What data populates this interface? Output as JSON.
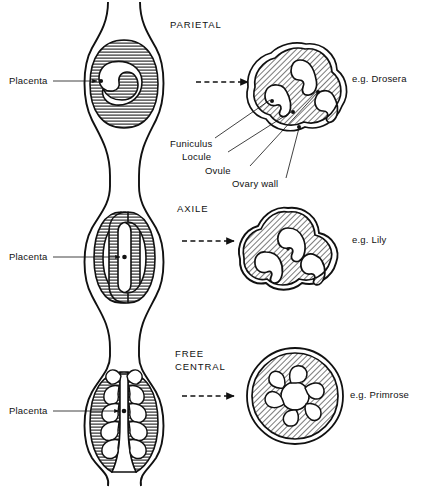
{
  "diagram": {
    "background": "#ffffff",
    "ink_color": "#111111"
  },
  "rows": [
    {
      "id": "parietal",
      "heading": "PARIETAL",
      "placenta_label": "Placenta",
      "example": "e.g. Drosera",
      "section_hatch": "horizontal",
      "cross_hatch": "diagonal",
      "locule_count": 3
    },
    {
      "id": "axile",
      "heading": "AXILE",
      "placenta_label": "Placenta",
      "example": "e.g. Lily",
      "section_hatch": "horizontal",
      "cross_hatch": "diagonal",
      "locule_count": 3
    },
    {
      "id": "free-central",
      "heading_line1": "FREE",
      "heading_line2": "CENTRAL",
      "placenta_label": "Placenta",
      "example": "e.g. Primrose",
      "section_hatch": "horizontal",
      "cross_hatch": "diagonal",
      "ovule_count": 6
    }
  ],
  "callouts": [
    {
      "id": "funiculus",
      "label": "Funiculus"
    },
    {
      "id": "locule",
      "label": "Locule"
    },
    {
      "id": "ovule",
      "label": "Ovule"
    },
    {
      "id": "ovary-wall",
      "label": "Ovary wall"
    }
  ]
}
